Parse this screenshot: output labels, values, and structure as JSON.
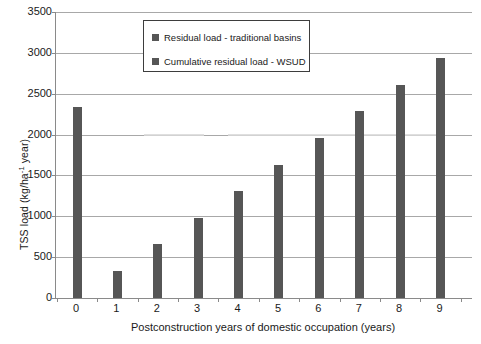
{
  "chart_data": {
    "type": "bar",
    "title": "",
    "xlabel": "Postconstruction years of domestic occupation (years)",
    "ylabel": "TSS load (kg/ha year)",
    "ylabel_prefix": "TSS load (kg/ha",
    "ylabel_suffix": " year)",
    "ylabel_exponent": "-1",
    "categories": [
      "0",
      "1",
      "2",
      "3",
      "4",
      "5",
      "6",
      "7",
      "8",
      "9"
    ],
    "ylim": [
      0,
      3500
    ],
    "yticks": [
      0,
      500,
      1000,
      1500,
      2000,
      2500,
      3000,
      3500
    ],
    "ytick_labels": [
      "0",
      "500",
      "1000",
      "1500",
      "2000",
      "2500",
      "3000",
      "3500"
    ],
    "grid": true,
    "legend_position": "top-center",
    "series": [
      {
        "name": "Residual load - traditional basins",
        "color": "#565656",
        "values": [
          2340,
          325,
          655,
          980,
          1305,
          1630,
          1960,
          2290,
          2610,
          2940
        ]
      },
      {
        "name": "Cumulative residual load - WSUD",
        "color": "#d9d9d9",
        "values": [
          2000,
          2000,
          2000,
          2000,
          2000,
          2000,
          2000,
          2000,
          2000,
          2000
        ]
      }
    ]
  },
  "legend": {
    "entries": [
      {
        "label": "Residual load - traditional basins"
      },
      {
        "label": "Cumulative residual load - WSUD"
      }
    ]
  }
}
